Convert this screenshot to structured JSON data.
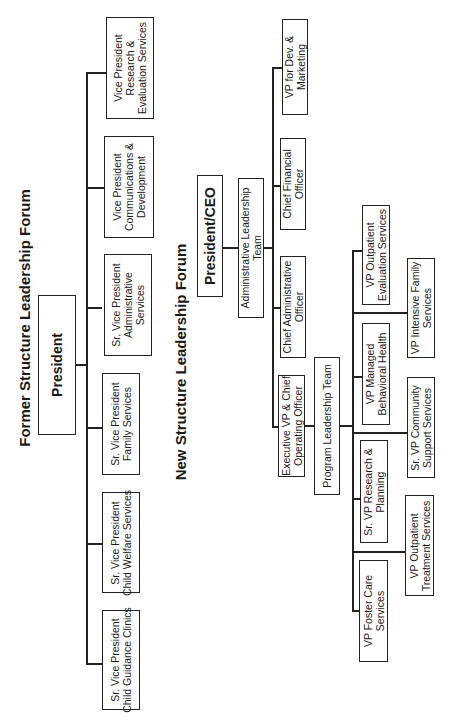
{
  "orientation": "rotated -90 degrees",
  "former": {
    "title": "Former Structure Leadership Forum",
    "top": "President",
    "children": [
      "Sr. Vice President\nChild Guidance Clinics",
      "Sr. Vice President\nChild Welfare Services",
      "Sr. Vice President\nFamily Services",
      "Sr. Vice President\nAdministrative\nServices",
      "Vice President\nCommunications &\nDevelopment",
      "Vice President\nResearch &\nEvaluation Services"
    ]
  },
  "new": {
    "title": "New Structure Leadership Forum",
    "top": "President/CEO",
    "admin_team": "Administrative Leadership\nTeam",
    "admin_children": [
      "Executive VP & Chief\nOperating Officer",
      "Chief Administrative\nOfficer",
      "Chief Financial\nOfficer",
      "VP for Dev. &\nMarketing"
    ],
    "program_team": "Program Leadership Team",
    "program_children": [
      "VP Foster Care\nServices",
      "VP Outpatient\nTreatment Services",
      "Sr. VP Research &\nPlanning",
      "Sr. VP Community\nSupport Services",
      "VP Managed\nBehavioral Health",
      "VP Intensive Family\nServices",
      "VP Outpatient\nEvaluation Services"
    ]
  }
}
